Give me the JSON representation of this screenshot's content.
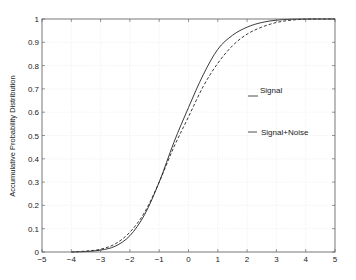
{
  "chart_data": {
    "type": "line",
    "title": "",
    "xlabel": "",
    "ylabel": "Accumulative Probability Distribution",
    "xlim": [
      -5,
      5
    ],
    "ylim": [
      0,
      1
    ],
    "grid": true,
    "xticks": [
      -5,
      -4,
      -3,
      -2,
      -1,
      0,
      1,
      2,
      3,
      4,
      5
    ],
    "xtick_labels": [
      "-5",
      "-4",
      "-3",
      "-2",
      "-1",
      "0",
      "1",
      "2",
      "3",
      "4",
      "5"
    ],
    "yticks": [
      0,
      0.1,
      0.2,
      0.3,
      0.4,
      0.5,
      0.6,
      0.7,
      0.8,
      0.9,
      1
    ],
    "ytick_labels": [
      "0",
      "0.1",
      "0.2",
      "0.3",
      "0.4",
      "0.5",
      "0.6",
      "0.7",
      "0.8",
      "0.9",
      "1"
    ],
    "legend": {
      "position": "inside-right",
      "entries": [
        "Signal",
        "Signal+Noise"
      ]
    },
    "x": [
      -4,
      -3.5,
      -3,
      -2.5,
      -2,
      -1.5,
      -1,
      -0.5,
      0,
      0.5,
      1,
      1.5,
      2,
      2.5,
      3,
      3.5,
      4,
      4.5,
      5
    ],
    "series": [
      {
        "name": "Signal",
        "style": "solid",
        "values": [
          0.0,
          0.002,
          0.008,
          0.025,
          0.07,
          0.16,
          0.3,
          0.47,
          0.62,
          0.76,
          0.87,
          0.93,
          0.965,
          0.985,
          0.995,
          0.999,
          1.0,
          1.0,
          1.0
        ]
      },
      {
        "name": "Signal+Noise",
        "style": "dashed",
        "values": [
          0.0,
          0.004,
          0.012,
          0.035,
          0.085,
          0.17,
          0.3,
          0.45,
          0.58,
          0.71,
          0.81,
          0.885,
          0.935,
          0.965,
          0.985,
          0.995,
          0.999,
          1.0,
          1.0
        ]
      }
    ]
  },
  "labels": {
    "ylabel": "Accumulative Probability Distribution",
    "legend_signal": "Signal",
    "legend_signal_noise": "Signal+Noise"
  }
}
